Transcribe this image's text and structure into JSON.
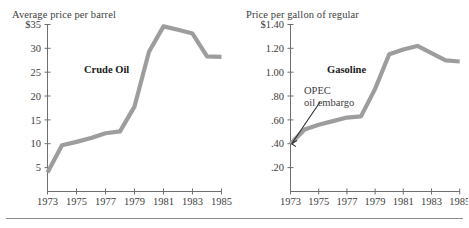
{
  "figure": {
    "background": "#ffffff",
    "line_color": "#9d9d9d",
    "axis_color": "#6e6e6e",
    "text_color": "#3d3d3d",
    "annotation_color": "#2b2b2b"
  },
  "panels": {
    "left": {
      "title": "Average price per barrel",
      "series_label": "Crude Oil",
      "ytick_labels": [
        "$35",
        "30",
        "25",
        "20",
        "15",
        "10",
        "5"
      ],
      "xtick_labels": [
        "1973",
        "1975",
        "1977",
        "1979",
        "1981",
        "1983",
        "1985"
      ]
    },
    "right": {
      "title": "Price per gallon of regular",
      "series_label": "Gasoline",
      "ytick_labels": [
        "$1.40",
        "1.20",
        "1.00",
        ".80",
        ".60",
        ".40",
        ".20"
      ],
      "xtick_labels": [
        "1973",
        "1975",
        "1977",
        "1979",
        "1981",
        "1983",
        "1985"
      ],
      "annotation_line1": "OPEC",
      "annotation_line2": "oil embargo"
    }
  },
  "chart_data": [
    {
      "type": "line",
      "title": "Average price per barrel",
      "subtitle": "",
      "xlabel": "",
      "ylabel": "Average price per barrel",
      "legend": [
        "Crude Oil"
      ],
      "legend_position": "inside-upper-left",
      "grid": false,
      "xlim": [
        1973,
        1985
      ],
      "ylim": [
        0,
        35
      ],
      "yticks": [
        5,
        10,
        15,
        20,
        25,
        30,
        35
      ],
      "ytick_labels": [
        "5",
        "10",
        "15",
        "20",
        "25",
        "30",
        "$35"
      ],
      "xticks": [
        1973,
        1975,
        1977,
        1979,
        1981,
        1983,
        1985
      ],
      "xtick_labels": [
        "1973",
        "1975",
        "1977",
        "1979",
        "1981",
        "1983",
        "1985"
      ],
      "series": [
        {
          "name": "Crude Oil",
          "x": [
            1973,
            1974,
            1975,
            1976,
            1977,
            1978,
            1979,
            1980,
            1981,
            1982,
            1983,
            1984,
            1985
          ],
          "values": [
            4.0,
            9.7,
            10.4,
            11.2,
            12.2,
            12.6,
            17.8,
            29.3,
            34.6,
            33.9,
            33.1,
            28.3,
            28.2
          ]
        }
      ],
      "annotations": [
        {
          "text": "Crude Oil",
          "x": 1975.6,
          "y": 26.0
        }
      ]
    },
    {
      "type": "line",
      "title": "Price per gallon of regular",
      "subtitle": "",
      "xlabel": "",
      "ylabel": "Price per gallon of regular",
      "legend": [
        "Gasoline"
      ],
      "legend_position": "inside-upper-left",
      "grid": false,
      "xlim": [
        1973,
        1985
      ],
      "ylim": [
        0,
        1.4
      ],
      "yticks": [
        0.2,
        0.4,
        0.6,
        0.8,
        1.0,
        1.2,
        1.4
      ],
      "ytick_labels": [
        ".20",
        ".40",
        ".60",
        ".80",
        "1.00",
        "1.20",
        "$1.40"
      ],
      "xticks": [
        1973,
        1975,
        1977,
        1979,
        1981,
        1983,
        1985
      ],
      "xtick_labels": [
        "1973",
        "1975",
        "1977",
        "1979",
        "1981",
        "1983",
        "1985"
      ],
      "series": [
        {
          "name": "Gasoline",
          "x": [
            1973,
            1974,
            1975,
            1976,
            1977,
            1978,
            1979,
            1980,
            1981,
            1982,
            1983,
            1984,
            1985
          ],
          "values": [
            0.4,
            0.52,
            0.56,
            0.59,
            0.62,
            0.63,
            0.86,
            1.15,
            1.19,
            1.22,
            1.16,
            1.1,
            1.09
          ]
        }
      ],
      "annotations": [
        {
          "text": "Gasoline",
          "x": 1975.6,
          "y": 1.06
        },
        {
          "text": "OPEC oil embargo",
          "x": 1974.3,
          "y": 0.84,
          "points_to_x": 1973,
          "points_to_y": 0.41
        }
      ]
    }
  ]
}
